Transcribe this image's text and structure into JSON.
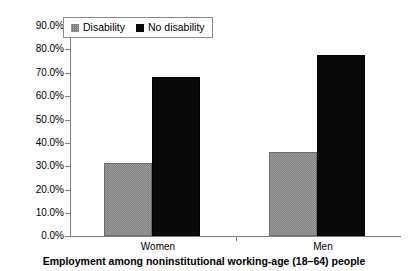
{
  "chart_data": {
    "type": "bar",
    "title": "",
    "caption": "Employment among noninstitutional working-age (18–64) people",
    "categories": [
      "Women",
      "Men"
    ],
    "series": [
      {
        "name": "Disability",
        "values": [
          31.5,
          36.0
        ],
        "color": "#808080"
      },
      {
        "name": "No disability",
        "values": [
          68.3,
          77.5
        ],
        "color": "#0a0a0a"
      }
    ],
    "xlabel": "",
    "ylabel": "",
    "ylim": [
      0,
      90
    ],
    "ytick_values": [
      90,
      80,
      70,
      60,
      50,
      40,
      30,
      20,
      10,
      0
    ],
    "ytick_labels": [
      "90.0%",
      "80.0%",
      "70.0%",
      "60.0%",
      "50.0%",
      "40.0%",
      "30.0%",
      "20.0%",
      "10.0%",
      "0.0%"
    ],
    "grid": false,
    "legend_position": "top-left"
  },
  "legend": {
    "entries": [
      {
        "label": "Disability"
      },
      {
        "label": "No disability"
      }
    ]
  }
}
